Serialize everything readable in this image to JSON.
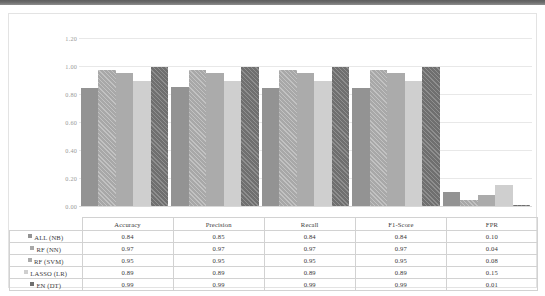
{
  "chart_data": {
    "type": "bar",
    "title": "",
    "xlabel": "",
    "ylabel": "",
    "ylim": [
      0.0,
      1.2
    ],
    "ytick_labels": [
      "1.20",
      "1.00",
      "0.80",
      "0.60",
      "0.40",
      "0.20",
      "0.00"
    ],
    "ytick_values": [
      1.2,
      1.0,
      0.8,
      0.6,
      0.4,
      0.2,
      0.0
    ],
    "grid": true,
    "legend_position": "table-below",
    "categories": [
      "Accuracy",
      "Precision",
      "Recall",
      "F1-Score",
      "FPR"
    ],
    "series": [
      {
        "name": "ALL (NB)",
        "color": "#939393",
        "values": [
          0.84,
          0.85,
          0.84,
          0.84,
          0.1
        ]
      },
      {
        "name": "RF (NN)",
        "color": "#a8a8a8",
        "values": [
          0.97,
          0.97,
          0.97,
          0.97,
          0.04
        ]
      },
      {
        "name": "RF (SVM)",
        "color": "#ababab",
        "values": [
          0.95,
          0.95,
          0.95,
          0.95,
          0.08
        ]
      },
      {
        "name": "LASSO (LR)",
        "color": "#cfcfcf",
        "values": [
          0.89,
          0.89,
          0.89,
          0.89,
          0.15
        ]
      },
      {
        "name": "EN (DT)",
        "color": "#6f6f6f",
        "values": [
          0.99,
          0.99,
          0.99,
          0.99,
          0.01
        ]
      }
    ],
    "value_labels": [
      [
        "0.84",
        "0.85",
        "0.84",
        "0.84",
        "0.10"
      ],
      [
        "0.97",
        "0.97",
        "0.97",
        "0.97",
        "0.04"
      ],
      [
        "0.95",
        "0.95",
        "0.95",
        "0.95",
        "0.08"
      ],
      [
        "0.89",
        "0.89",
        "0.89",
        "0.89",
        "0.15"
      ],
      [
        "0.99",
        "0.99",
        "0.99",
        "0.99",
        "0.01"
      ]
    ]
  }
}
